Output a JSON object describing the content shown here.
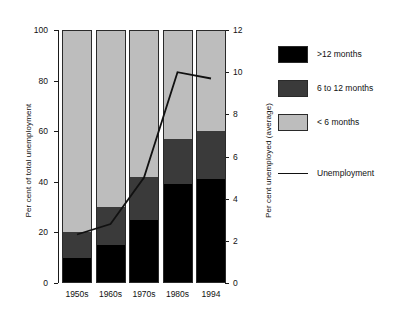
{
  "chart_data": {
    "type": "bar",
    "title": "",
    "subtitle": "",
    "categories": [
      "1950s",
      "1960s",
      "1970s",
      "1980s",
      "1994"
    ],
    "xlabel": "",
    "ylabel": "Per cent of total unemployment",
    "y2label": "Per cent unemployed (average)",
    "ylim": [
      0,
      100
    ],
    "y2lim": [
      0,
      12
    ],
    "yticks": [
      0,
      20,
      40,
      60,
      80,
      100
    ],
    "y2ticks": [
      0,
      2,
      4,
      6,
      8,
      10,
      12
    ],
    "grid": false,
    "legend_position": "right",
    "stacked": true,
    "series": [
      {
        "name": ">12 months",
        "color": "#000000",
        "values": [
          10,
          15,
          25,
          39,
          41
        ]
      },
      {
        "name": "6 to 12 months",
        "color": "#3a3a3a",
        "values": [
          10,
          15,
          17,
          18,
          19
        ]
      },
      {
        "name": "< 6 months",
        "color": "#bdbdbd",
        "values": [
          80,
          70,
          58,
          43,
          40
        ]
      }
    ],
    "overlay_line": {
      "name": "Unemployment",
      "color": "#111111",
      "axis": "right",
      "values": [
        2.3,
        2.8,
        5.0,
        10.0,
        9.7
      ]
    }
  },
  "axes": {
    "left": {
      "title": "Per cent of total unemployment",
      "ticks": [
        "0",
        "20",
        "40",
        "60",
        "80",
        "100"
      ]
    },
    "right": {
      "title": "Per cent unemployed (average)",
      "ticks": [
        "0",
        "2",
        "4",
        "6",
        "8",
        "10",
        "12"
      ]
    },
    "x": {
      "ticks": [
        "1950s",
        "1960s",
        "1970s",
        "1980s",
        "1994"
      ]
    }
  },
  "legend": {
    "items": [
      {
        "label": ">12 months",
        "swatch": "#000000"
      },
      {
        "label": "6 to 12 months",
        "swatch": "#3a3a3a"
      },
      {
        "label": "< 6 months",
        "swatch": "#bdbdbd"
      }
    ],
    "line_item": {
      "label": "Unemployment",
      "color": "#111111"
    }
  }
}
